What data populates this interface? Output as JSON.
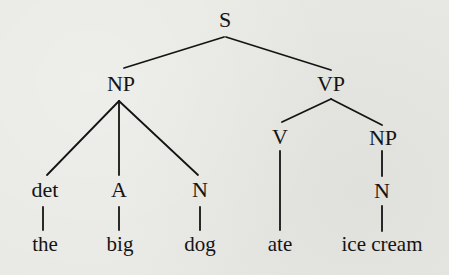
{
  "diagram": {
    "type": "syntax-tree",
    "nodes": {
      "s": {
        "label": "S",
        "x": 225,
        "y": 20
      },
      "np1": {
        "label": "NP",
        "x": 121,
        "y": 83
      },
      "vp": {
        "label": "VP",
        "x": 331,
        "y": 84
      },
      "det": {
        "label": "det",
        "x": 45,
        "y": 189
      },
      "a": {
        "label": "A",
        "x": 119,
        "y": 189
      },
      "n1": {
        "label": "N",
        "x": 200,
        "y": 189
      },
      "v": {
        "label": "V",
        "x": 280,
        "y": 161
      },
      "np2": {
        "label": "NP",
        "x": 383,
        "y": 162
      },
      "n2": {
        "label": "N",
        "x": 382,
        "y": 192
      },
      "w_the": {
        "label": "the",
        "x": 45,
        "y": 244
      },
      "w_big": {
        "label": "big",
        "x": 120,
        "y": 244
      },
      "w_dog": {
        "label": "dog",
        "x": 200,
        "y": 244
      },
      "w_ate": {
        "label": "ate",
        "x": 280,
        "y": 244
      },
      "w_icecream": {
        "label": "ice cream",
        "x": 382,
        "y": 244
      }
    },
    "edges": [
      {
        "from": "S",
        "to": "NP"
      },
      {
        "from": "S",
        "to": "VP"
      },
      {
        "from": "NP",
        "to": "det"
      },
      {
        "from": "NP",
        "to": "A"
      },
      {
        "from": "NP",
        "to": "N"
      },
      {
        "from": "VP",
        "to": "V"
      },
      {
        "from": "VP",
        "to": "NP"
      },
      {
        "from": "det",
        "to": "the"
      },
      {
        "from": "A",
        "to": "big"
      },
      {
        "from": "N",
        "to": "dog"
      },
      {
        "from": "V",
        "to": "ate"
      },
      {
        "from": "NP",
        "to": "N"
      },
      {
        "from": "N",
        "to": "ice cream"
      }
    ],
    "sentence": "the big dog ate ice cream"
  }
}
